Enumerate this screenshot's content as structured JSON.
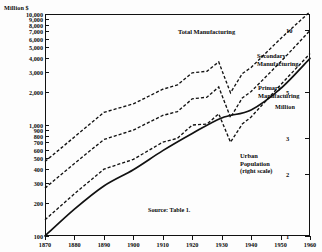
{
  "chart_data": {
    "type": "line",
    "title": "",
    "xlabel": "",
    "ylabel": "Million $",
    "y2label": "Million",
    "xlim": [
      1870,
      1960
    ],
    "ylim": [
      100,
      10000
    ],
    "y2lim": [
      1,
      12
    ],
    "yscale": "log",
    "y2scale": "log",
    "grid": false,
    "legend": "inline-annotations",
    "source": "Source: Table 1.",
    "left_axis_title": "Million $",
    "right_axis_title": "Million",
    "xticks": [
      1870,
      1880,
      1890,
      1900,
      1910,
      1920,
      1930,
      1940,
      1950,
      1960
    ],
    "xticklabels": [
      "1870",
      "1880",
      "1890",
      "1900",
      "1910",
      "1920",
      "1930",
      "1940",
      "1950",
      "1960"
    ],
    "yticks": [
      100,
      200,
      300,
      400,
      500,
      600,
      700,
      800,
      900,
      1000,
      2000,
      3000,
      4000,
      5000,
      6000,
      7000,
      8000,
      9000,
      10000
    ],
    "yticklabels": [
      "100",
      "200",
      "300",
      "400",
      "500",
      "600",
      "700",
      "800",
      "900",
      "1,000",
      "2,000",
      "3,000",
      "4,000",
      "5,000",
      "6,000",
      "7,000",
      "8,000",
      "9,000",
      "10,000"
    ],
    "y2ticks": [
      1,
      2,
      3,
      5,
      10
    ],
    "y2ticklabels": [
      "1",
      "2",
      "3",
      "5",
      "10"
    ],
    "series": [
      {
        "name": "Total Manufacturing",
        "style": "dashed",
        "axis": "left",
        "units": "Million $",
        "x": [
          1870,
          1880,
          1890,
          1900,
          1910,
          1915,
          1920,
          1925,
          1929,
          1933,
          1937,
          1940,
          1950,
          1960
        ],
        "values": [
          470,
          780,
          1300,
          1550,
          2100,
          2300,
          2950,
          3050,
          3700,
          1950,
          2900,
          3300,
          6000,
          10500
        ]
      },
      {
        "name": "Secondary Manufacturing",
        "style": "dashed",
        "axis": "left",
        "units": "Million $",
        "x": [
          1870,
          1880,
          1890,
          1900,
          1910,
          1915,
          1920,
          1925,
          1929,
          1933,
          1937,
          1940,
          1950,
          1960
        ],
        "values": [
          270,
          450,
          740,
          900,
          1220,
          1320,
          1720,
          1780,
          2200,
          1170,
          1750,
          2000,
          3700,
          7100
        ]
      },
      {
        "name": "Primary Manufacturing",
        "style": "dashed",
        "axis": "left",
        "units": "Million $",
        "x": [
          1870,
          1880,
          1890,
          1900,
          1910,
          1915,
          1920,
          1925,
          1929,
          1933,
          1937,
          1940,
          1950,
          1960
        ],
        "values": [
          140,
          240,
          400,
          490,
          700,
          760,
          1000,
          1020,
          1260,
          700,
          1020,
          1180,
          2300,
          4400
        ]
      },
      {
        "name": "Urban Population",
        "style": "solid",
        "axis": "right",
        "units": "Million",
        "x": [
          1870,
          1880,
          1890,
          1900,
          1910,
          1920,
          1930,
          1940,
          1950,
          1960
        ],
        "values": [
          1.0,
          1.35,
          1.75,
          2.1,
          2.6,
          3.15,
          3.75,
          4.1,
          5.2,
          7.3
        ]
      }
    ],
    "annotations": [
      {
        "name": "total-manufacturing-label",
        "text": "Total Manufacturing"
      },
      {
        "name": "secondary-manufacturing-label",
        "text": "Secondary\nManufacturing"
      },
      {
        "name": "primary-manufacturing-label",
        "text": "Primary\nManufacturing"
      },
      {
        "name": "urban-population-label",
        "text": "Urban\nPopulation\n(right scale)"
      }
    ]
  }
}
